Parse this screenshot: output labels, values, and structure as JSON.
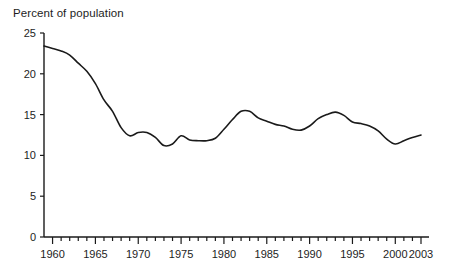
{
  "chart_data": {
    "type": "line",
    "title": "Percent of population",
    "xlabel": "",
    "ylabel": "",
    "ylim": [
      0,
      25
    ],
    "xlim": [
      1959,
      2003
    ],
    "grid": false,
    "legend": null,
    "yticks": [
      0,
      5,
      10,
      15,
      20,
      25
    ],
    "ytick_labels": [
      "0",
      "5",
      "10",
      "15",
      "20",
      "25"
    ],
    "xticks": [
      1960,
      1965,
      1970,
      1975,
      1980,
      1985,
      1990,
      1995,
      2000,
      2003
    ],
    "xtick_labels": [
      "1960",
      "1965",
      "1970",
      "1975",
      "1980",
      "1985",
      "1990",
      "1995",
      "2000",
      "2003"
    ],
    "xtick_minor_step": 1,
    "line_color": "#1a1a1a",
    "line_width": 1.6,
    "x": [
      1959,
      1960,
      1961,
      1962,
      1963,
      1964,
      1965,
      1966,
      1967,
      1968,
      1969,
      1970,
      1971,
      1972,
      1973,
      1974,
      1975,
      1976,
      1977,
      1978,
      1979,
      1980,
      1981,
      1982,
      1983,
      1984,
      1985,
      1986,
      1987,
      1988,
      1989,
      1990,
      1991,
      1992,
      1993,
      1994,
      1995,
      1996,
      1997,
      1998,
      1999,
      2000,
      2001,
      2002,
      2003
    ],
    "series": [
      {
        "name": "Percent of population",
        "values": [
          23.4,
          23.1,
          22.8,
          22.3,
          21.3,
          20.3,
          18.8,
          16.8,
          15.4,
          13.4,
          12.4,
          12.8,
          12.8,
          12.2,
          11.2,
          11.4,
          12.4,
          11.9,
          11.8,
          11.8,
          12.1,
          13.2,
          14.4,
          15.4,
          15.4,
          14.6,
          14.2,
          13.8,
          13.6,
          13.2,
          13.1,
          13.6,
          14.5,
          15.0,
          15.3,
          14.9,
          14.1,
          13.9,
          13.6,
          13.0,
          12.0,
          11.4,
          11.8,
          12.2,
          12.5
        ]
      }
    ]
  }
}
